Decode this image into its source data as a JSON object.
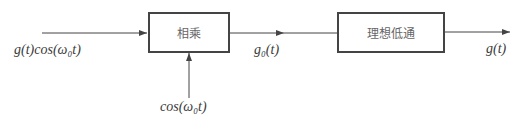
{
  "diagram": {
    "type": "block-diagram",
    "blocks": [
      {
        "id": "multiplier",
        "label": "相乘"
      },
      {
        "id": "lowpass",
        "label": "理想低通"
      }
    ],
    "signals": {
      "input": "g(t)cos(ω₀t)",
      "carrier": "cos(ω₀t)",
      "intermediate": "g₀(t)",
      "output": "g(t)"
    },
    "colors": {
      "line": "#444444",
      "text": "#3a3a3a"
    }
  }
}
